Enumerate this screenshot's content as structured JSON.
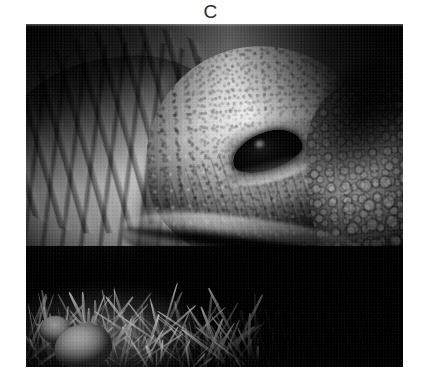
{
  "figure": {
    "panel_label": "C",
    "caption": "",
    "photo": {
      "alt_description": "Grayscale close-up photograph of a giant tortoise head resting on grass",
      "subject": "giant tortoise",
      "orientation": "landscape",
      "color_mode": "grayscale",
      "frame": {
        "x": 26,
        "y": 24,
        "width": 377,
        "height": 343
      },
      "regions": [
        {
          "name": "neck-folds",
          "description": "deeply wrinkled neck skin, left side"
        },
        {
          "name": "head-dome",
          "description": "smooth domed head, center"
        },
        {
          "name": "eye",
          "description": "dark almond-shaped eye, center-right"
        },
        {
          "name": "scaly-skin",
          "description": "pebbled scaly skin and scutes, right side"
        },
        {
          "name": "jaw-line",
          "description": "shadowed mouth and jaw line, lower center"
        },
        {
          "name": "grass-bed",
          "description": "straw and grass with bright stone, bottom-left"
        },
        {
          "name": "dark-background",
          "description": "deep black background, top-right and bottom-right"
        }
      ]
    }
  },
  "colors": {
    "page_background": "#ffffff",
    "label_text": "#2b2b2b",
    "photo_shadow": "#050505",
    "photo_highlight": "#f0ede6",
    "photo_midtone": "#9a9a9a"
  }
}
